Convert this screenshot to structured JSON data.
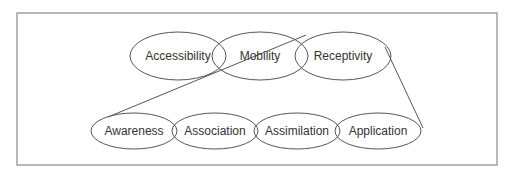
{
  "diagram": {
    "frame": {
      "x": 17,
      "y": 13,
      "width": 480,
      "height": 152,
      "stroke": "#8a8a8a"
    },
    "stroke_color": "#555555",
    "text_color": "#333333",
    "top_row": [
      {
        "label": "Accessibility",
        "cx": 178,
        "cy": 56,
        "rx": 48,
        "ry": 24
      },
      {
        "label": "Mobility",
        "cx": 260,
        "cy": 56,
        "rx": 48,
        "ry": 24
      },
      {
        "label": "Receptivity",
        "cx": 343,
        "cy": 56,
        "rx": 48,
        "ry": 24
      }
    ],
    "bottom_row": [
      {
        "label": "Awareness",
        "cx": 134,
        "cy": 131,
        "rx": 43,
        "ry": 18
      },
      {
        "label": "Association",
        "cx": 215,
        "cy": 131,
        "rx": 43,
        "ry": 18
      },
      {
        "label": "Assimilation",
        "cx": 297,
        "cy": 131,
        "rx": 43,
        "ry": 18
      },
      {
        "label": "Application",
        "cx": 378,
        "cy": 131,
        "rx": 43,
        "ry": 18
      }
    ],
    "connectors": [
      {
        "from": "Awareness",
        "to": "Receptivity",
        "x1": 108,
        "y1": 117,
        "x2": 306,
        "y2": 35
      },
      {
        "from": "Receptivity",
        "to": "Application",
        "x1": 385,
        "y1": 47,
        "x2": 423,
        "y2": 128
      }
    ]
  }
}
